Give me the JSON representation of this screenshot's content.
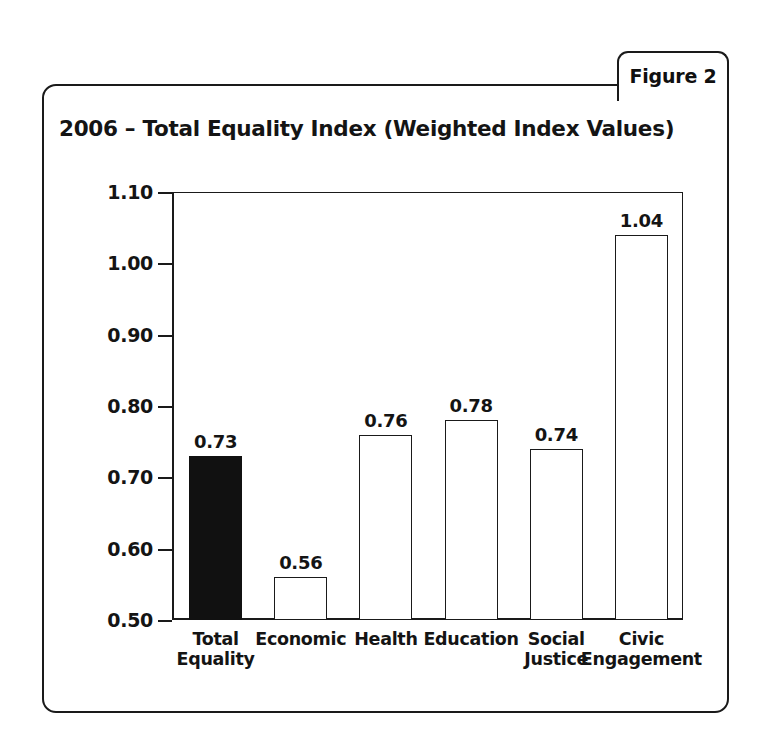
{
  "figure_tab": {
    "label": "Figure 2"
  },
  "chart_data": {
    "type": "bar",
    "title": "2006 – Total Equality Index (Weighted Index Values)",
    "xlabel": "",
    "ylabel": "",
    "ylim": [
      0.5,
      1.1
    ],
    "ytick_labels": [
      "1.10",
      "1.00",
      "0.90",
      "0.80",
      "0.70",
      "0.60",
      "0.50"
    ],
    "yticks": [
      1.1,
      1.0,
      0.9,
      0.8,
      0.7,
      0.6,
      0.5
    ],
    "grid": false,
    "legend": "none",
    "categories": [
      "Total\nEquality",
      "Economic",
      "Health",
      "Education",
      "Social\nJustice",
      "Civic\nEngagement"
    ],
    "values": [
      0.73,
      0.56,
      0.76,
      0.78,
      0.74,
      1.04
    ],
    "value_labels": [
      "0.73",
      "0.56",
      "0.76",
      "0.78",
      "0.74",
      "1.04"
    ],
    "bar_fills": [
      "solid",
      "open",
      "open",
      "open",
      "open",
      "open"
    ],
    "colors": {
      "bar_fill_solid": "#111111",
      "bar_fill_open": "#ffffff",
      "bar_outline": "#1a1a1a",
      "axis": "#1a1a1a",
      "text": "#141414",
      "background": "#ffffff"
    }
  }
}
